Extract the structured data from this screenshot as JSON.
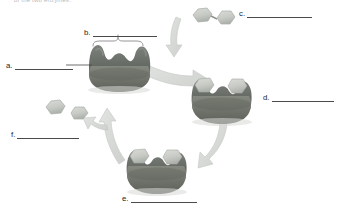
{
  "figure": {
    "top_caption": "of the two enzymes.",
    "diagram_type": "enzyme catalytic cycle",
    "background_color": "#ffffff"
  },
  "labels": [
    {
      "key": "a.",
      "id": "label-a",
      "blank": ""
    },
    {
      "key": "b.",
      "id": "label-b",
      "blank": ""
    },
    {
      "key": "c.",
      "id": "label-c",
      "blank": ""
    },
    {
      "key": "d.",
      "id": "label-d",
      "blank": ""
    },
    {
      "key": "e.",
      "id": "label-e",
      "blank": ""
    },
    {
      "key": "f.",
      "id": "label-f",
      "blank": ""
    }
  ],
  "colors": {
    "enzyme_body": "#6f736f",
    "enzyme_body_dark": "#4f534f",
    "enzyme_highlight": "#8d918c",
    "molecule_fill": "#c9ccc8",
    "molecule_dark": "#a9ada8",
    "arrow_fill": "#d6d8d5",
    "arrow_edge": "#c2c4c1",
    "label_text": "#2b2b2b",
    "blank_rule": "#4a4a4a",
    "brace": "#8a8a8a"
  },
  "elements": {
    "enzyme_free": "enzyme with two empty binding pockets",
    "enzyme_substrate_complex": "enzyme with two substrate molecules bound",
    "enzyme_product_complex": "enzyme with two cleaved product molecules bound",
    "substrate_pair": "two joined hexagonal substrate molecules",
    "product_pair": "two separated product molecules",
    "brace": "curly brace spanning enzyme binding region",
    "arrow_top": "curved arrow from free enzyme to enzyme-substrate complex",
    "arrow_right": "curved arrow from enzyme-substrate complex to enzyme-product complex",
    "arrow_left": "curved arrow from enzyme-product complex back to free enzyme",
    "arrow_substrate_in": "branch arrow showing substrate entering",
    "arrow_product_out": "branch arrow showing products leaving"
  }
}
